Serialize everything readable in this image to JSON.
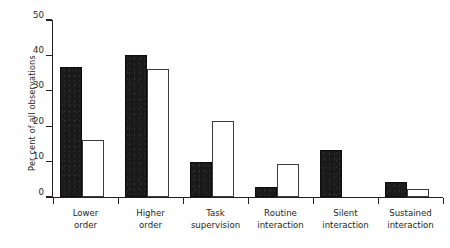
{
  "chart_data": {
    "type": "bar",
    "title": "",
    "xlabel": "",
    "ylabel": "Per cent of all observations",
    "ylim": [
      0,
      50
    ],
    "yticks": [
      0,
      10,
      20,
      30,
      40,
      50
    ],
    "grid": false,
    "legend": null,
    "categories": [
      "Lower order",
      "Higher order",
      "Task supervision",
      "Routine interaction",
      "Silent interaction",
      "Sustained interaction"
    ],
    "category_lines": [
      [
        "Lower",
        "order"
      ],
      [
        "Higher",
        "order"
      ],
      [
        "Task",
        "supervision"
      ],
      [
        "Routine",
        "interaction"
      ],
      [
        "Silent",
        "interaction"
      ],
      [
        "Sustained",
        "interaction"
      ]
    ],
    "series": [
      {
        "name": "filled",
        "style": "solid-black",
        "color": "#1a1a1a",
        "values": [
          36.6,
          40.2,
          10.0,
          2.9,
          13.4,
          4.2
        ]
      },
      {
        "name": "hollow",
        "style": "white-outline",
        "color": "#ffffff",
        "values": [
          16.0,
          36.3,
          21.5,
          9.4,
          0,
          2.4
        ]
      }
    ]
  },
  "colors": {
    "axis": "#231f20",
    "filled_bar": "#1a1a1a",
    "hollow_bar_fill": "#ffffff",
    "hollow_bar_stroke": "#3b3b3b",
    "background": "#ffffff"
  }
}
